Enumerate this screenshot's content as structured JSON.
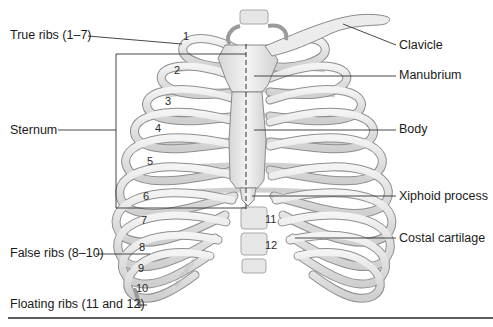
{
  "figure": {
    "labels_left": {
      "true_ribs": "True ribs (1–7)",
      "sternum": "Sternum",
      "false_ribs": "False ribs (8–10)",
      "floating_ribs": "Floating ribs (11 and 12)"
    },
    "labels_right": {
      "clavicle": "Clavicle",
      "manubrium": "Manubrium",
      "body": "Body",
      "xiphoid": "Xiphoid process",
      "costal_cartilage": "Costal cartilage"
    },
    "rib_numbers": [
      "1",
      "2",
      "3",
      "4",
      "5",
      "6",
      "7",
      "8",
      "9",
      "10",
      "11",
      "12"
    ],
    "artist_signature": "McMahon",
    "colors": {
      "bone_fill": "#e4e4e4",
      "bone_stroke": "#8a8a8a",
      "cartilage_fill": "#f2f2f2",
      "leader_line": "#333333",
      "rule": "#5a5a5a"
    }
  }
}
